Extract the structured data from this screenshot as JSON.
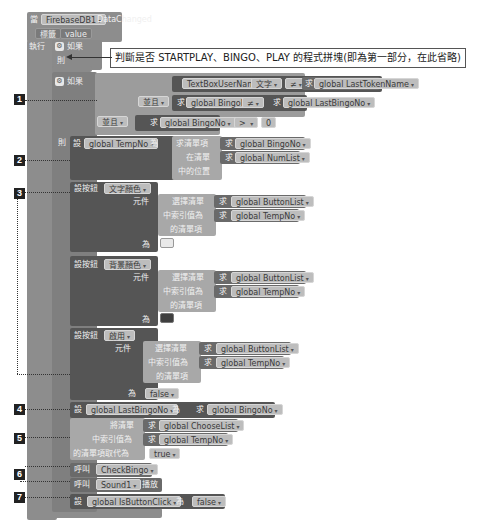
{
  "event": {
    "when": "當",
    "component": "FirebaseDB1",
    "event_name": "DataChanged",
    "params": [
      "標籤",
      "value"
    ],
    "do": "執行"
  },
  "if1": {
    "label": "如果",
    "then": "則"
  },
  "callout": "判斷是否 STARTPLAY、BINGO、PLAY 的程式拼塊(即為第一部分，在此省略)",
  "if2": {
    "label": "如果",
    "cond_a": {
      "left": "TextBoxUserName",
      "prop": "文字",
      "op": "≠",
      "get": "求",
      "right": "global LastTokenName"
    },
    "and1": "並且",
    "cond_b": {
      "get": "求",
      "left": "global BingoNo",
      "op": "≠",
      "right": "global LastBingoNo"
    },
    "and2": "並且",
    "cond_c": {
      "get": "求",
      "left": "global BingoNo",
      "op": "> ",
      "right": "0"
    },
    "then": "則"
  },
  "step2": {
    "set": "設",
    "var": "global TempNo",
    "to": "為",
    "index_of": "求清單項",
    "get": "求",
    "item": "global BingoNo",
    "in_list": "在清單",
    "list": "global NumList",
    "pos": "中的位置"
  },
  "step3": [
    {
      "set": "設按鈕",
      "prop": "文字顏色",
      "elem": "元件",
      "select": "選擇清單",
      "get": "求",
      "list": "global ButtonList",
      "idx_label": "中索引值為",
      "idx": "global TempNo",
      "item_label": "的清單項",
      "to": "為",
      "value": "",
      "swatch": "#e9e9e9"
    },
    {
      "set": "設按鈕",
      "prop": "背景顏色",
      "elem": "元件",
      "select": "選擇清單",
      "get": "求",
      "list": "global ButtonList",
      "idx_label": "中索引值為",
      "idx": "global TempNo",
      "item_label": "的清單項",
      "to": "為",
      "value": "",
      "swatch": "#3f3f3f"
    },
    {
      "set": "設按鈕",
      "prop": "啟用",
      "elem": "元件",
      "select": "選擇清單",
      "get": "求",
      "list": "global ButtonList",
      "idx_label": "中索引值為",
      "idx": "global TempNo",
      "item_label": "的清單項",
      "to": "為",
      "value": "false"
    }
  ],
  "step4": {
    "set": "設",
    "var": "global LastBingoNo",
    "to": "為",
    "get": "求",
    "value": "global BingoNo"
  },
  "step5": {
    "list_label": "將清單",
    "get": "求",
    "list": "global ChooseList",
    "idx_label": "中索引值為",
    "idx": "global TempNo",
    "replace_label": "的清單項取代為",
    "value": "true"
  },
  "step6": [
    {
      "call": "呼叫",
      "proc": "CheckBingo"
    },
    {
      "call": "呼叫",
      "proc": "Sound1",
      "method": "播放"
    }
  ],
  "step7": {
    "set": "設",
    "var": "global IsButtonClick",
    "to": "為",
    "value": "false"
  },
  "markers": [
    "1",
    "2",
    "3",
    "4",
    "5",
    "6",
    "7"
  ]
}
